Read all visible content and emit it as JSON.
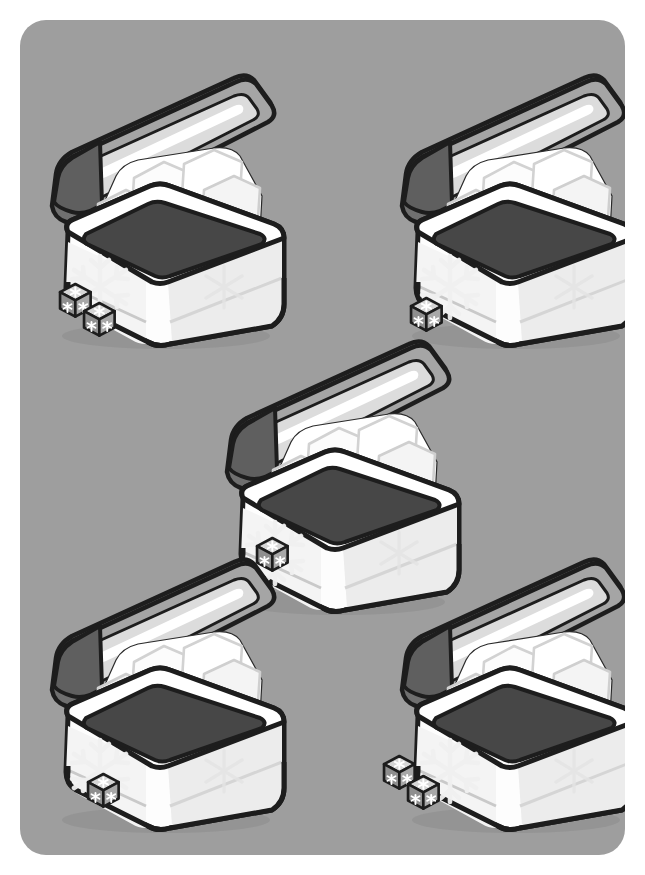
{
  "card": {
    "kind": "illustration-card",
    "background_color": "#ffffff",
    "panel_color": "#9e9e9e",
    "panel_corner_radius": 26,
    "width": 645,
    "height": 875,
    "title": ""
  },
  "palette": {
    "panel_gray": "#9e9e9e",
    "outline": "#1d1d1d",
    "cooler_body_white": "#fdfdfd",
    "cooler_body_shade": "#f1f1f1",
    "cooler_side_shade": "#e6e6e6",
    "lid_top_gray": "#9d9d9d",
    "lid_under_gray": "#6a6a6a",
    "lid_highlight": "#ffffff",
    "interior_dark": "#4f4f4f",
    "ice_white": "#ffffff",
    "ice_shade": "#e2e2e2",
    "ice_shade_deep": "#cfcfcf",
    "die_light": "#d8d8d8",
    "die_mid": "#9a9a9a",
    "die_dark": "#6f6f6f",
    "die_pip": "#ffffff",
    "emboss_snowflake": "#f4f4f4"
  },
  "layout": {
    "arrangement": "quincunx",
    "rows": [
      2,
      1,
      2
    ],
    "total_coolers": 5,
    "total_dice": 7
  },
  "coolers": [
    {
      "id": "cooler-top-left",
      "label": "Cooler 1",
      "x": 38,
      "y": 56,
      "scale": 1.0,
      "dice_count": 2,
      "dice_position": "bottom-left",
      "lid_state": "open",
      "ice_cubes": 7,
      "snowflake_emblem": true
    },
    {
      "id": "cooler-top-right",
      "label": "Cooler 2",
      "x": 388,
      "y": 56,
      "scale": 1.0,
      "dice_count": 1,
      "dice_position": "bottom-left",
      "lid_state": "open",
      "ice_cubes": 7,
      "snowflake_emblem": true
    },
    {
      "id": "cooler-center",
      "label": "Cooler 3",
      "x": 213,
      "y": 322,
      "scale": 1.0,
      "dice_count": 1,
      "dice_position": "bottom-left",
      "lid_state": "open",
      "ice_cubes": 7,
      "snowflake_emblem": true
    },
    {
      "id": "cooler-bottom-left",
      "label": "Cooler 4",
      "x": 38,
      "y": 540,
      "scale": 1.0,
      "dice_count": 1,
      "dice_position": "bottom-left",
      "lid_state": "open",
      "ice_cubes": 7,
      "snowflake_emblem": true
    },
    {
      "id": "cooler-bottom-right",
      "label": "Cooler 5",
      "x": 388,
      "y": 540,
      "scale": 1.0,
      "dice_count": 2,
      "dice_position": "bottom-left",
      "lid_state": "open",
      "ice_cubes": 7,
      "snowflake_emblem": true
    }
  ],
  "die": {
    "face_symbol": "snowflake",
    "visible_faces": 3,
    "pips_per_face": 1,
    "size": 34
  }
}
